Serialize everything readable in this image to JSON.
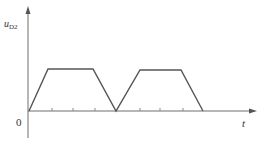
{
  "diagram": {
    "y_axis_label": "u",
    "y_axis_subscript": "D2",
    "x_axis_label": "t",
    "origin_label": "0",
    "colors": {
      "axis": "#6e6e6e",
      "waveform": "#555555",
      "text": "#333333"
    },
    "waveform_description": "Two trapezoidal pulses: linear rise, flat top, linear fall to zero, repeated",
    "pulses": [
      {
        "rise_start": 29,
        "top_start": 48,
        "top_end": 93,
        "fall_end": 116
      },
      {
        "rise_start": 116,
        "top_start": 140,
        "top_end": 181,
        "fall_end": 203
      }
    ],
    "ticks_x": [
      52,
      73,
      95,
      140,
      160,
      183
    ]
  }
}
